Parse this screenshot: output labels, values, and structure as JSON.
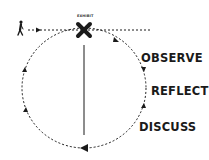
{
  "diagram": {
    "marker_label": "EXHIBIT",
    "stages": [
      {
        "label": "OBSERVE"
      },
      {
        "label": "REFLECT"
      },
      {
        "label": "DISCUSS"
      }
    ],
    "icons": {
      "person": "walking-person-icon",
      "marker": "x-mark-icon"
    },
    "colors": {
      "ink": "#1a1a1a",
      "background": "#ffffff"
    }
  }
}
